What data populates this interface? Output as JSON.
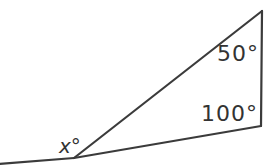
{
  "figure": {
    "labels": {
      "angle_top_right": "50°",
      "angle_bottom_right": "100°",
      "angle_exterior": "x°"
    },
    "colors": {
      "line": "#3b3b3b",
      "text": "#333333",
      "background": "#ffffff"
    }
  }
}
